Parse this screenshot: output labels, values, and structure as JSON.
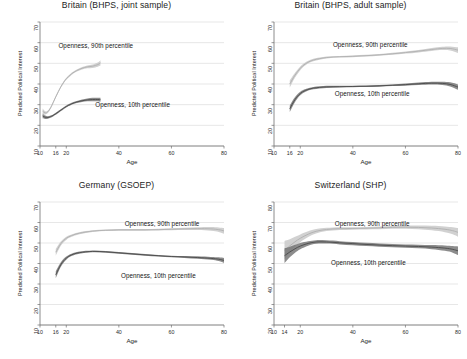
{
  "figure": {
    "rows": 2,
    "cols": 2,
    "ylabel": "Predicted Political Interest",
    "xlabel": "Age",
    "series_labels": {
      "high": "Openness, 90th percentile",
      "low": "Openness, 10th percentile"
    },
    "colors": {
      "band_high": "#c9c9c9",
      "line_high": "#b0b0b0",
      "band_low": "#6f6f6f",
      "line_low": "#4a4a4a",
      "grid": "#cfcfcf",
      "axis": "#6e6e6e"
    }
  },
  "chart_data": [
    {
      "type": "line",
      "title": "Britain (BHPS, joint sample)",
      "xlabel": "Age",
      "ylabel": "Predicted Political Interest",
      "xlim": [
        10,
        80
      ],
      "ylim": [
        10,
        70
      ],
      "xticks": [
        10,
        16,
        20,
        40,
        60,
        80
      ],
      "yticks": [
        10,
        20,
        30,
        40,
        50,
        60,
        70
      ],
      "grid": true,
      "legend": "inline-annotations",
      "series": [
        {
          "name": "Openness, 90th percentile",
          "x": [
            11,
            12,
            13,
            14,
            15,
            16,
            17,
            18,
            19,
            20,
            22,
            24,
            26,
            28,
            30,
            32,
            33
          ],
          "values": [
            26.8,
            26.0,
            26.6,
            28.4,
            31.0,
            33.8,
            36.4,
            38.8,
            40.8,
            42.5,
            44.9,
            46.5,
            47.6,
            48.3,
            48.6,
            49.4,
            50.2
          ],
          "band_low": [
            25.4,
            25.2,
            26.0,
            27.9,
            30.5,
            33.3,
            35.9,
            38.3,
            40.3,
            42.0,
            44.4,
            46.0,
            47.0,
            47.6,
            47.8,
            48.4,
            48.9
          ],
          "band_high": [
            28.2,
            26.8,
            27.2,
            28.9,
            31.5,
            34.3,
            36.9,
            39.3,
            41.3,
            43.0,
            45.4,
            47.0,
            48.2,
            49.0,
            49.4,
            50.4,
            51.5
          ]
        },
        {
          "name": "Openness, 10th percentile",
          "x": [
            11,
            12,
            13,
            14,
            15,
            16,
            17,
            18,
            19,
            20,
            22,
            24,
            26,
            28,
            30,
            32,
            33
          ],
          "values": [
            24.5,
            23.9,
            23.8,
            24.2,
            24.8,
            25.6,
            26.5,
            27.4,
            28.3,
            29.1,
            30.4,
            31.3,
            31.9,
            32.3,
            32.5,
            32.5,
            32.4
          ],
          "band_low": [
            23.4,
            23.1,
            23.2,
            23.7,
            24.3,
            25.1,
            26.0,
            26.9,
            27.8,
            28.6,
            29.9,
            30.8,
            31.3,
            31.6,
            31.7,
            31.6,
            31.4
          ],
          "band_high": [
            25.6,
            24.7,
            24.4,
            24.7,
            25.3,
            26.1,
            27.0,
            27.9,
            28.8,
            29.6,
            30.9,
            31.8,
            32.5,
            33.0,
            33.3,
            33.4,
            33.4
          ]
        }
      ]
    },
    {
      "type": "line",
      "title": "Britain (BHPS, adult sample)",
      "xlabel": "Age",
      "ylabel": "Predicted Political Interest",
      "xlim": [
        10,
        80
      ],
      "ylim": [
        10,
        70
      ],
      "xticks": [
        10,
        16,
        20,
        40,
        60,
        80
      ],
      "yticks": [
        10,
        20,
        30,
        40,
        50,
        60,
        70
      ],
      "grid": true,
      "legend": "inline-annotations",
      "series": [
        {
          "name": "Openness, 90th percentile",
          "x": [
            16,
            18,
            20,
            22,
            25,
            30,
            35,
            40,
            45,
            50,
            55,
            60,
            65,
            70,
            74,
            77,
            80
          ],
          "values": [
            40.0,
            44.3,
            47.6,
            49.8,
            51.6,
            52.8,
            53.2,
            53.4,
            53.7,
            54.1,
            54.6,
            55.2,
            55.9,
            56.7,
            57.2,
            57.2,
            56.4
          ],
          "band_low": [
            38.2,
            43.1,
            46.7,
            49.1,
            51.0,
            52.3,
            52.8,
            53.0,
            53.3,
            53.7,
            54.1,
            54.7,
            55.3,
            56.0,
            56.4,
            56.2,
            55.0
          ],
          "band_high": [
            41.8,
            45.5,
            48.5,
            50.5,
            52.2,
            53.3,
            53.6,
            53.8,
            54.1,
            54.5,
            55.1,
            55.7,
            56.5,
            57.4,
            58.0,
            58.2,
            57.8
          ]
        },
        {
          "name": "Openness, 10th percentile",
          "x": [
            16,
            18,
            20,
            22,
            25,
            30,
            35,
            40,
            45,
            50,
            55,
            60,
            65,
            70,
            74,
            77,
            80
          ],
          "values": [
            28.0,
            32.5,
            35.4,
            36.9,
            38.0,
            38.6,
            38.7,
            38.8,
            38.9,
            39.1,
            39.4,
            39.7,
            40.1,
            40.4,
            40.3,
            39.8,
            38.5
          ],
          "band_low": [
            26.4,
            31.3,
            34.5,
            36.2,
            37.4,
            38.1,
            38.3,
            38.4,
            38.5,
            38.7,
            39.0,
            39.2,
            39.5,
            39.7,
            39.5,
            38.8,
            37.2
          ],
          "band_high": [
            29.6,
            33.7,
            36.3,
            37.6,
            38.6,
            39.1,
            39.1,
            39.2,
            39.3,
            39.5,
            39.8,
            40.2,
            40.7,
            41.1,
            41.1,
            40.8,
            39.8
          ]
        }
      ]
    },
    {
      "type": "line",
      "title": "Germany (GSOEP)",
      "xlabel": "Age",
      "ylabel": "Predicted Political Interest",
      "xlim": [
        10,
        80
      ],
      "ylim": [
        10,
        70
      ],
      "xticks": [
        10,
        16,
        20,
        40,
        60,
        80
      ],
      "yticks": [
        10,
        20,
        30,
        40,
        50,
        60,
        70
      ],
      "grid": true,
      "legend": "inline-annotations",
      "series": [
        {
          "name": "Openness, 90th percentile",
          "x": [
            16,
            18,
            20,
            22,
            25,
            30,
            35,
            40,
            45,
            50,
            55,
            60,
            65,
            70,
            75,
            78,
            80
          ],
          "values": [
            45.5,
            49.8,
            52.3,
            53.6,
            54.8,
            55.8,
            56.2,
            56.4,
            56.4,
            56.4,
            56.5,
            56.7,
            56.9,
            57.0,
            56.9,
            56.5,
            55.9
          ],
          "band_low": [
            43.9,
            48.8,
            51.5,
            53.0,
            54.3,
            55.4,
            55.8,
            56.0,
            56.0,
            56.0,
            56.1,
            56.2,
            56.3,
            56.3,
            56.0,
            55.4,
            54.5
          ],
          "band_high": [
            47.1,
            50.8,
            53.1,
            54.2,
            55.3,
            56.2,
            56.6,
            56.8,
            56.8,
            56.8,
            56.9,
            57.2,
            57.5,
            57.7,
            57.8,
            57.6,
            57.3
          ]
        },
        {
          "name": "Openness, 10th percentile",
          "x": [
            16,
            18,
            20,
            22,
            25,
            30,
            35,
            40,
            45,
            50,
            55,
            60,
            65,
            70,
            75,
            78,
            80
          ],
          "values": [
            34.5,
            39.6,
            42.6,
            44.2,
            45.3,
            45.9,
            45.7,
            45.2,
            44.7,
            44.2,
            43.8,
            43.4,
            43.2,
            42.9,
            42.5,
            42.1,
            41.5
          ],
          "band_low": [
            32.8,
            38.5,
            41.8,
            43.6,
            44.8,
            45.5,
            45.3,
            44.8,
            44.3,
            43.8,
            43.4,
            43.0,
            42.7,
            42.3,
            41.8,
            41.2,
            40.3
          ],
          "band_high": [
            36.2,
            40.7,
            43.4,
            44.8,
            45.8,
            46.3,
            46.1,
            45.6,
            45.1,
            44.6,
            44.2,
            43.8,
            43.7,
            43.5,
            43.2,
            43.0,
            42.7
          ]
        }
      ]
    },
    {
      "type": "line",
      "title": "Switzerland (SHP)",
      "xlabel": "Age",
      "ylabel": "Predicted Political Interest",
      "xlim": [
        10,
        80
      ],
      "ylim": [
        20,
        80
      ],
      "xticks": [
        10,
        14,
        20,
        40,
        60,
        80
      ],
      "yticks": [
        20,
        30,
        40,
        50,
        60,
        70,
        80
      ],
      "grid": true,
      "legend": "inline-annotations",
      "series": [
        {
          "name": "Openness, 90th percentile",
          "x": [
            14,
            16,
            18,
            20,
            23,
            26,
            30,
            35,
            40,
            45,
            50,
            55,
            60,
            65,
            70,
            75,
            78,
            80
          ],
          "values": [
            56.5,
            58.6,
            60.6,
            62.3,
            64.3,
            65.7,
            66.6,
            67.0,
            67.1,
            67.2,
            67.4,
            67.6,
            67.7,
            67.6,
            67.3,
            66.7,
            66.0,
            65.2
          ],
          "band_low": [
            52.0,
            55.4,
            58.2,
            60.4,
            62.9,
            64.6,
            65.8,
            66.3,
            66.5,
            66.6,
            66.7,
            66.9,
            66.9,
            66.7,
            66.2,
            65.3,
            64.3,
            63.1
          ],
          "band_high": [
            61.0,
            61.8,
            63.0,
            64.2,
            65.7,
            66.8,
            67.4,
            67.7,
            67.7,
            67.8,
            68.1,
            68.3,
            68.5,
            68.5,
            68.4,
            68.1,
            67.7,
            67.3
          ]
        },
        {
          "name": "Openness, 10th percentile",
          "x": [
            14,
            16,
            18,
            20,
            23,
            26,
            30,
            35,
            40,
            45,
            50,
            55,
            60,
            65,
            70,
            75,
            78,
            80
          ],
          "values": [
            53.8,
            55.6,
            57.2,
            58.5,
            59.8,
            60.5,
            60.5,
            60.1,
            59.7,
            59.3,
            59.0,
            58.7,
            58.5,
            58.3,
            58.0,
            57.5,
            56.9,
            56.2
          ],
          "band_low": [
            50.2,
            53.0,
            55.3,
            57.0,
            58.7,
            59.6,
            59.7,
            59.3,
            58.9,
            58.5,
            58.2,
            57.9,
            57.7,
            57.4,
            57.0,
            56.2,
            55.3,
            54.1
          ],
          "band_high": [
            57.4,
            58.2,
            59.1,
            60.0,
            60.9,
            61.4,
            61.3,
            60.9,
            60.5,
            60.1,
            59.8,
            59.5,
            59.3,
            59.2,
            59.0,
            58.8,
            58.5,
            58.3
          ]
        }
      ]
    }
  ]
}
